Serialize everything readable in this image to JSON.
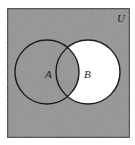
{
  "diagram": {
    "type": "venn",
    "universe_label": "U",
    "sets": [
      {
        "label": "A",
        "shaded": true
      },
      {
        "label": "B",
        "shaded": false
      }
    ],
    "shaded_region": "A ∪ B'",
    "colors": {
      "shade": "#8f8f8f",
      "unshaded": "#ffffff",
      "stroke": "#1a1a1a"
    }
  }
}
